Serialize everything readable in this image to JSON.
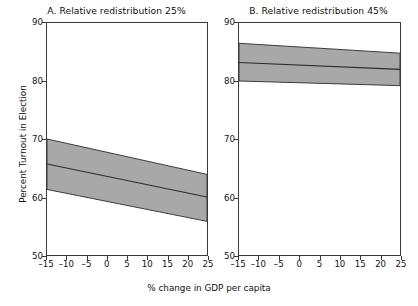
{
  "figure": {
    "xlabel": "% change in GDP per capita",
    "ylabel": "Percent Turnout in Election",
    "footer_caption": "",
    "band_fill_color": "#a8a8a8",
    "band_edge_color": "#3a3a3a",
    "line_color": "#2b2b2b",
    "axis_color": "#3a3a3a",
    "background_color": "#ffffff"
  },
  "chart_data": [
    {
      "type": "line",
      "panel": "A",
      "title": "A. Relative redistribution 25%",
      "xlabel": "% change in GDP per capita",
      "ylabel": "Percent Turnout in Election",
      "xlim": [
        -15,
        25
      ],
      "ylim": [
        50,
        90
      ],
      "xticks": [
        -15,
        -10,
        -5,
        0,
        5,
        10,
        15,
        20,
        25
      ],
      "xtick_labels": [
        "–15",
        "–10",
        "–5",
        "0",
        "5",
        "10",
        "15",
        "20",
        "25"
      ],
      "yticks": [
        50,
        60,
        70,
        80,
        90
      ],
      "ytick_labels": [
        "50",
        "60",
        "70",
        "80",
        "90"
      ],
      "grid": false,
      "legend": "none",
      "series": [
        {
          "name": "Predicted turnout",
          "x": [
            -15,
            25
          ],
          "values": [
            65.7,
            60.0
          ]
        },
        {
          "name": "95% CI upper",
          "x": [
            -15,
            25
          ],
          "values": [
            70.0,
            63.9
          ]
        },
        {
          "name": "95% CI lower",
          "x": [
            -15,
            25
          ],
          "values": [
            61.3,
            55.8
          ]
        }
      ]
    },
    {
      "type": "line",
      "panel": "B",
      "title": "B. Relative redistribution 45%",
      "xlabel": "% change in GDP per capita",
      "ylabel": "Percent Turnout in Election",
      "xlim": [
        -15,
        25
      ],
      "ylim": [
        50,
        90
      ],
      "xticks": [
        -15,
        -10,
        -5,
        0,
        5,
        10,
        15,
        20,
        25
      ],
      "xtick_labels": [
        "–15",
        "–10",
        "–5",
        "0",
        "5",
        "10",
        "15",
        "20",
        "25"
      ],
      "yticks": [
        50,
        60,
        70,
        80,
        90
      ],
      "ytick_labels": [
        "50",
        "60",
        "70",
        "80",
        "90"
      ],
      "grid": false,
      "legend": "none",
      "series": [
        {
          "name": "Predicted turnout",
          "x": [
            -15,
            25
          ],
          "values": [
            83.2,
            82.0
          ]
        },
        {
          "name": "95% CI upper",
          "x": [
            -15,
            25
          ],
          "values": [
            86.5,
            84.8
          ]
        },
        {
          "name": "95% CI lower",
          "x": [
            -15,
            25
          ],
          "values": [
            80.0,
            79.2
          ]
        }
      ]
    }
  ]
}
